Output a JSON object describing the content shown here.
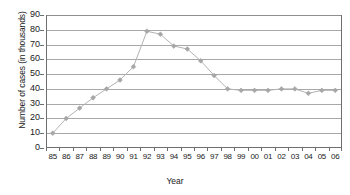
{
  "chart_data": {
    "type": "line",
    "title": "",
    "xlabel": "Year",
    "ylabel": "Number of cases (in thousands)",
    "categories": [
      "85",
      "86",
      "87",
      "88",
      "89",
      "90",
      "91",
      "92",
      "93",
      "94",
      "95",
      "96",
      "97",
      "98",
      "99",
      "00",
      "01",
      "02",
      "03",
      "04",
      "05",
      "06"
    ],
    "values": [
      10,
      20,
      27,
      34,
      40,
      46,
      55,
      79,
      77,
      69,
      67,
      59,
      49,
      40,
      39,
      39,
      39,
      40,
      40,
      37,
      39,
      39
    ],
    "series": [
      {
        "name": "Number of cases",
        "values": [
          10,
          20,
          27,
          34,
          40,
          46,
          55,
          79,
          77,
          69,
          67,
          59,
          49,
          40,
          39,
          39,
          39,
          40,
          40,
          37,
          39,
          39
        ]
      }
    ],
    "ylim": [
      0,
      90
    ],
    "yticks": [
      0,
      10,
      20,
      30,
      40,
      50,
      60,
      70,
      80,
      90
    ],
    "ytick_labels": [
      "0",
      "10",
      "20",
      "30",
      "40",
      "50",
      "60",
      "70",
      "80",
      "90"
    ],
    "grid": true,
    "legend": false,
    "legend_position": "none",
    "line_color": "#b3b3b3",
    "marker_color": "#a6a6a6",
    "grid_color": "#a8a8a8",
    "axis_color": "#6e6e6e",
    "background_color": "#ffffff",
    "marker": "diamond",
    "annotations": []
  }
}
